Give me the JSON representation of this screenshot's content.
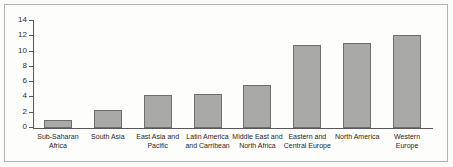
{
  "chart_data": {
    "type": "bar",
    "title": "",
    "subtitle": "",
    "xlabel": "",
    "ylabel": "",
    "ylim": [
      0,
      14
    ],
    "yticks": [
      0,
      2,
      4,
      6,
      8,
      10,
      12,
      14
    ],
    "ytick_labels": [
      "0",
      "2",
      "4",
      "6",
      "8",
      "10",
      "12",
      "14"
    ],
    "grid": false,
    "legend": false,
    "bar_color": "#a9a9a8",
    "bar_edge_color": "#6f6f70",
    "axis_color": "#58585a",
    "background_color": "#fdfdfc",
    "frame_color": "#b4b4b2",
    "categories": [
      "Sub-Saharan\nAfrica",
      "South Asia",
      "East Asia and\nPacific",
      "Latin America\nand Carribean",
      "Middle East and\nNorth Africa",
      "Eastern and\nCentral Europe",
      "North America",
      "Western\nEurope"
    ],
    "values": [
      1.1,
      2.3,
      4.3,
      4.5,
      5.6,
      10.8,
      11.1,
      12.2
    ]
  }
}
